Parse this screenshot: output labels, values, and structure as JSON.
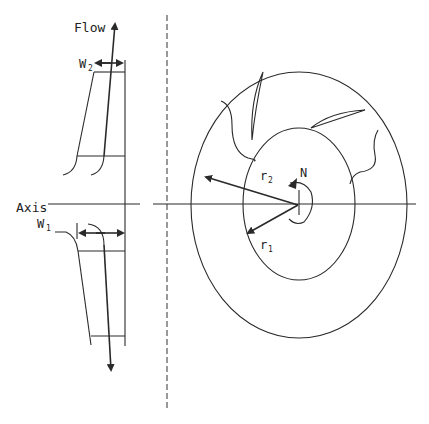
{
  "diagram": {
    "type": "centrifugal-impeller-schematic",
    "labels": {
      "flow": "Flow",
      "axis": "Axis",
      "w2": "W",
      "w2_sub": "2",
      "w1": "W",
      "w1_sub": "1",
      "r2": "r",
      "r2_sub": "2",
      "r1": "r",
      "r1_sub": "1",
      "rotation": "N"
    },
    "views": [
      {
        "name": "meridional-section",
        "description": "Side view of impeller passage with inlet width W1 and outlet width W2"
      },
      {
        "name": "front-view",
        "description": "Impeller eye view showing inlet radius r1, outlet radius r2, blades and rotation N"
      }
    ],
    "colors": {
      "line": "#2a2a2a",
      "background": "#ffffff"
    }
  }
}
